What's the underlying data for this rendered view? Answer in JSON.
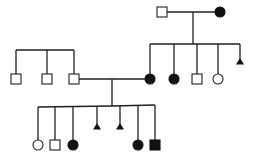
{
  "diagram": {
    "type": "pedigree",
    "colors": {
      "line": "#222222",
      "affected": "#111111",
      "unaffected": "#ffffff"
    },
    "generations": [
      {
        "id": "I",
        "individuals": [
          {
            "id": "I-1",
            "sex": "male",
            "affected": false,
            "x": 162,
            "y": 12
          },
          {
            "id": "I-2",
            "sex": "female",
            "affected": true,
            "x": 220,
            "y": 12
          }
        ]
      },
      {
        "id": "II",
        "individuals": [
          {
            "id": "II-1",
            "sex": "male",
            "affected": false,
            "x": 16,
            "y": 79
          },
          {
            "id": "II-2",
            "sex": "male",
            "affected": false,
            "x": 47,
            "y": 79
          },
          {
            "id": "II-3",
            "sex": "male",
            "affected": false,
            "x": 74,
            "y": 79
          },
          {
            "id": "II-4",
            "sex": "female",
            "affected": true,
            "x": 150,
            "y": 79
          },
          {
            "id": "II-5",
            "sex": "female",
            "affected": true,
            "x": 174,
            "y": 79
          },
          {
            "id": "II-6",
            "sex": "male",
            "affected": false,
            "x": 197,
            "y": 79
          },
          {
            "id": "II-7",
            "sex": "female",
            "affected": false,
            "x": 218,
            "y": 79
          },
          {
            "id": "II-8",
            "sex": "miscarriage",
            "affected": true,
            "x": 240,
            "y": 62
          }
        ]
      },
      {
        "id": "III",
        "individuals": [
          {
            "id": "III-1",
            "sex": "female",
            "affected": false,
            "x": 38,
            "y": 145
          },
          {
            "id": "III-2",
            "sex": "male",
            "affected": false,
            "x": 55,
            "y": 145
          },
          {
            "id": "III-3",
            "sex": "female",
            "affected": true,
            "x": 73,
            "y": 145
          },
          {
            "id": "III-4",
            "sex": "miscarriage",
            "affected": true,
            "x": 97,
            "y": 128
          },
          {
            "id": "III-5",
            "sex": "miscarriage",
            "affected": true,
            "x": 120,
            "y": 128
          },
          {
            "id": "III-6",
            "sex": "female",
            "affected": true,
            "x": 138,
            "y": 145
          },
          {
            "id": "III-7",
            "sex": "male",
            "affected": true,
            "x": 155,
            "y": 145
          }
        ]
      }
    ],
    "matings": [
      {
        "partners": [
          "I-1",
          "I-2"
        ],
        "children": [
          "II-4",
          "II-5",
          "II-6",
          "II-7",
          "II-8"
        ]
      },
      {
        "partners": [
          "II-3",
          "II-4"
        ],
        "children": [
          "III-1",
          "III-2",
          "III-3",
          "III-4",
          "III-5",
          "III-6",
          "III-7"
        ]
      }
    ],
    "sibships_without_parents": [
      {
        "children": [
          "II-1",
          "II-2",
          "II-3"
        ]
      }
    ]
  }
}
